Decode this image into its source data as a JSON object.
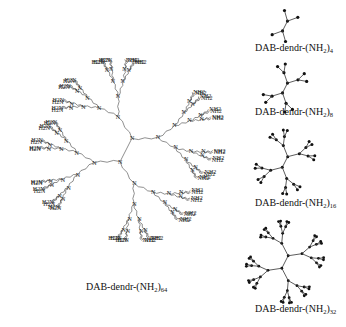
{
  "figure": {
    "main": {
      "label_prefix": "DAB-dendr-(NH",
      "label_sub1": "2",
      "label_mid": ")",
      "label_sub2": "64",
      "terminal_group_left": "H2N",
      "terminal_group_right": "NH2",
      "branch_atom": "N",
      "terminal_count": 64
    },
    "generations": [
      {
        "label_prefix": "DAB-dendr-(NH",
        "sub1": "2",
        "mid": ")",
        "sub2": "4",
        "endpoints": 4
      },
      {
        "label_prefix": "DAB-dendr-(NH",
        "sub1": "2",
        "mid": ")",
        "sub2": "8",
        "endpoints": 8
      },
      {
        "label_prefix": "DAB-dendr-(NH",
        "sub1": "2",
        "mid": ")",
        "sub2": "16",
        "endpoints": 16
      },
      {
        "label_prefix": "DAB-dendr-(NH",
        "sub1": "2",
        "mid": ")",
        "sub2": "32",
        "endpoints": 32
      }
    ],
    "colors": {
      "line": "#333333",
      "node": "#111111",
      "background": "#ffffff"
    }
  }
}
